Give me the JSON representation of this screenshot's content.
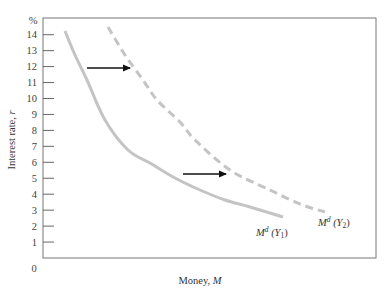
{
  "chart_data": {
    "type": "line",
    "title": "",
    "xlabel": "Money, M",
    "ylabel": "Interest rate, r",
    "y_unit_label": "%",
    "x_origin_label": "0",
    "ylim": [
      0,
      15
    ],
    "yticks": [
      1,
      2,
      3,
      4,
      5,
      6,
      7,
      8,
      9,
      10,
      11,
      12,
      13,
      14
    ],
    "grid": false,
    "legend": "none (curves labeled directly)",
    "series": [
      {
        "name": "Md (Y1)",
        "label_main": "M",
        "label_sup": "d",
        "label_arg": "(Y",
        "label_sub": "1",
        "label_close": ")",
        "style": "solid",
        "color": "#c4c4c4",
        "points_px": [
          [
            65,
            31
          ],
          [
            75,
            55
          ],
          [
            87,
            80
          ],
          [
            105,
            120
          ],
          [
            128,
            150
          ],
          [
            150,
            163
          ],
          [
            175,
            178
          ],
          [
            200,
            190
          ],
          [
            225,
            200
          ],
          [
            250,
            207
          ],
          [
            283,
            217
          ]
        ],
        "r_values": [
          14.3,
          12.8,
          11.2,
          8.7,
          6.8,
          6.0,
          5.0,
          4.3,
          3.6,
          3.2,
          2.6
        ]
      },
      {
        "name": "Md (Y2)",
        "label_main": "M",
        "label_sup": "d",
        "label_arg": "(Y",
        "label_sub": "2",
        "label_close": ")",
        "style": "dashed",
        "color": "#c4c4c4",
        "points_px": [
          [
            108,
            27
          ],
          [
            125,
            55
          ],
          [
            143,
            80
          ],
          [
            157,
            100
          ],
          [
            180,
            122
          ],
          [
            195,
            140
          ],
          [
            230,
            170
          ],
          [
            270,
            190
          ],
          [
            300,
            204
          ],
          [
            325,
            212
          ]
        ],
        "r_values": [
          14.5,
          12.8,
          11.2,
          9.9,
          8.5,
          7.4,
          5.5,
          4.3,
          3.4,
          2.9
        ]
      }
    ],
    "annotations": [
      {
        "type": "arrow",
        "direction": "right",
        "y_value": 12,
        "meaning": "shift of money demand from Y1 to Y2"
      },
      {
        "type": "arrow",
        "direction": "right",
        "y_value": 5.3,
        "meaning": "shift of money demand from Y1 to Y2"
      }
    ]
  }
}
